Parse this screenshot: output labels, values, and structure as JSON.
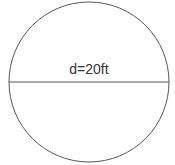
{
  "diagram": {
    "shape": "circle",
    "label": "d=20ft",
    "diameter_value": 20,
    "diameter_unit": "ft",
    "stroke_color": "#555555",
    "text_color": "#333333"
  }
}
